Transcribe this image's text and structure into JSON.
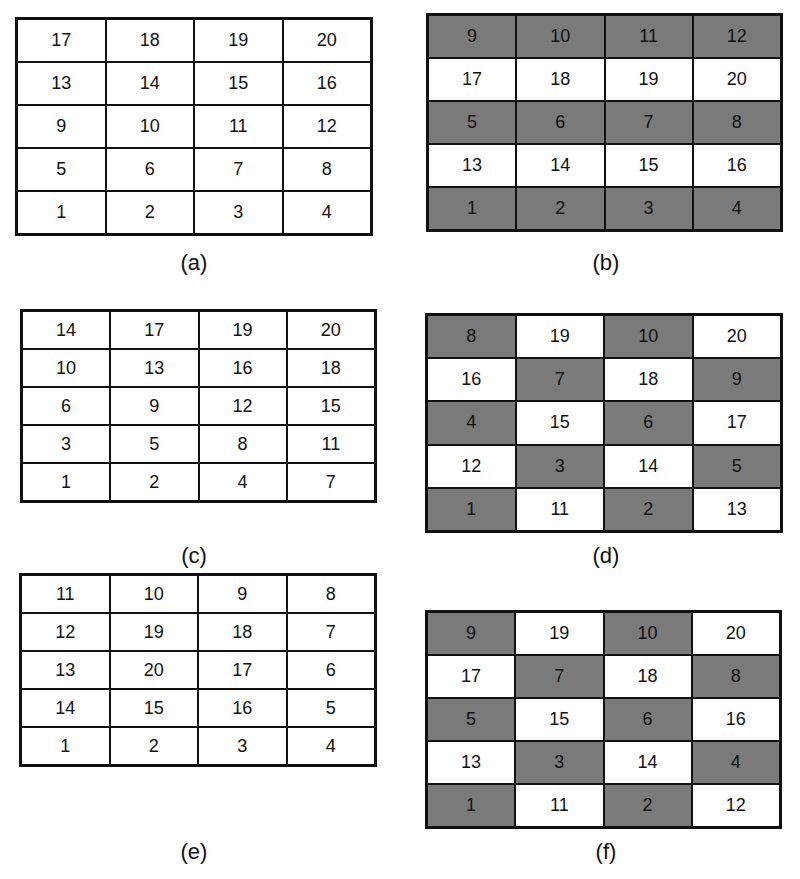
{
  "panels": [
    {
      "id": "a",
      "caption": "(a)",
      "left": 15,
      "top": 17,
      "width": 358,
      "height": 219,
      "capX": 164,
      "capY": 250,
      "rows": [
        [
          17,
          18,
          19,
          20
        ],
        [
          13,
          14,
          15,
          16
        ],
        [
          9,
          10,
          11,
          12
        ],
        [
          5,
          6,
          7,
          8
        ],
        [
          1,
          2,
          3,
          4
        ]
      ],
      "shaded": [
        [
          0,
          0,
          0,
          0
        ],
        [
          0,
          0,
          0,
          0
        ],
        [
          0,
          0,
          0,
          0
        ],
        [
          0,
          0,
          0,
          0
        ],
        [
          0,
          0,
          0,
          0
        ]
      ]
    },
    {
      "id": "b",
      "caption": "(b)",
      "left": 426,
      "top": 13,
      "width": 357,
      "height": 219,
      "capX": 576,
      "capY": 250,
      "rows": [
        [
          9,
          10,
          11,
          12
        ],
        [
          17,
          18,
          19,
          20
        ],
        [
          5,
          6,
          7,
          8
        ],
        [
          13,
          14,
          15,
          16
        ],
        [
          1,
          2,
          3,
          4
        ]
      ],
      "shaded": [
        [
          1,
          1,
          1,
          1
        ],
        [
          0,
          0,
          0,
          0
        ],
        [
          1,
          1,
          1,
          1
        ],
        [
          0,
          0,
          0,
          0
        ],
        [
          1,
          1,
          1,
          1
        ]
      ]
    },
    {
      "id": "c",
      "caption": "(c)",
      "left": 20,
      "top": 309,
      "width": 357,
      "height": 194,
      "capX": 164,
      "capY": 543,
      "rows": [
        [
          14,
          17,
          19,
          20
        ],
        [
          10,
          13,
          16,
          18
        ],
        [
          6,
          9,
          12,
          15
        ],
        [
          3,
          5,
          8,
          11
        ],
        [
          1,
          2,
          4,
          7
        ]
      ],
      "shaded": [
        [
          0,
          0,
          0,
          0
        ],
        [
          0,
          0,
          0,
          0
        ],
        [
          0,
          0,
          0,
          0
        ],
        [
          0,
          0,
          0,
          0
        ],
        [
          0,
          0,
          0,
          0
        ]
      ]
    },
    {
      "id": "d",
      "caption": "(d)",
      "left": 425,
      "top": 313,
      "width": 358,
      "height": 220,
      "capX": 576,
      "capY": 543,
      "rows": [
        [
          8,
          19,
          10,
          20
        ],
        [
          16,
          7,
          18,
          9
        ],
        [
          4,
          15,
          6,
          17
        ],
        [
          12,
          3,
          14,
          5
        ],
        [
          1,
          11,
          2,
          13
        ]
      ],
      "shaded": [
        [
          1,
          0,
          1,
          0
        ],
        [
          0,
          1,
          0,
          1
        ],
        [
          1,
          0,
          1,
          0
        ],
        [
          0,
          1,
          0,
          1
        ],
        [
          1,
          0,
          1,
          0
        ]
      ]
    },
    {
      "id": "e",
      "caption": "(e)",
      "left": 19,
      "top": 573,
      "width": 358,
      "height": 194,
      "capX": 164,
      "capY": 839,
      "rows": [
        [
          11,
          10,
          9,
          8
        ],
        [
          12,
          19,
          18,
          7
        ],
        [
          13,
          20,
          17,
          6
        ],
        [
          14,
          15,
          16,
          5
        ],
        [
          1,
          2,
          3,
          4
        ]
      ],
      "shaded": [
        [
          0,
          0,
          0,
          0
        ],
        [
          0,
          0,
          0,
          0
        ],
        [
          0,
          0,
          0,
          0
        ],
        [
          0,
          0,
          0,
          0
        ],
        [
          0,
          0,
          0,
          0
        ]
      ]
    },
    {
      "id": "f",
      "caption": "(f)",
      "left": 425,
      "top": 610,
      "width": 357,
      "height": 219,
      "capX": 576,
      "capY": 839,
      "rows": [
        [
          9,
          19,
          10,
          20
        ],
        [
          17,
          7,
          18,
          8
        ],
        [
          5,
          15,
          6,
          16
        ],
        [
          13,
          3,
          14,
          4
        ],
        [
          1,
          11,
          2,
          12
        ]
      ],
      "shaded": [
        [
          1,
          0,
          1,
          0
        ],
        [
          0,
          1,
          0,
          1
        ],
        [
          1,
          0,
          1,
          0
        ],
        [
          0,
          1,
          0,
          1
        ],
        [
          1,
          0,
          1,
          0
        ]
      ]
    }
  ],
  "colors": {
    "shaded": "#7a7a7a",
    "unshaded": "#ffffff",
    "border": "#111111"
  }
}
